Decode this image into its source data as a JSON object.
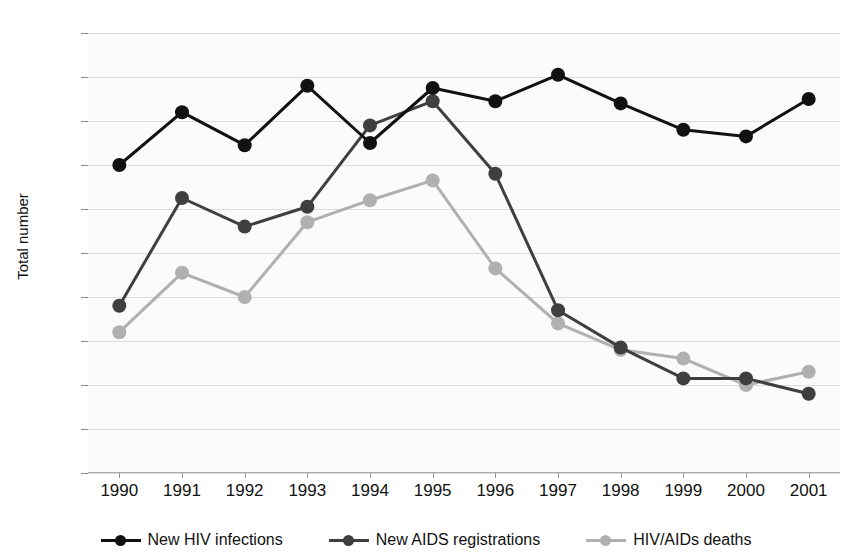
{
  "chart_data": {
    "type": "line",
    "title": "",
    "xlabel": "",
    "ylabel": "Total number",
    "categories": [
      "1990",
      "1991",
      "1992",
      "1993",
      "1994",
      "1995",
      "1996",
      "1997",
      "1998",
      "1999",
      "2000",
      "2001"
    ],
    "x": [
      1990,
      1991,
      1992,
      1993,
      1994,
      1995,
      1996,
      1997,
      1998,
      1999,
      2000,
      2001
    ],
    "ylim": [
      0,
      200
    ],
    "ytick_step": 20,
    "yticks": [
      0,
      20,
      40,
      60,
      80,
      100,
      120,
      140,
      160,
      180,
      200
    ],
    "grid": true,
    "legend_position": "bottom",
    "series": [
      {
        "name": "New HIV infections",
        "color": "#111111",
        "values": [
          140,
          164,
          149,
          176,
          150,
          175,
          169,
          181,
          168,
          156,
          153,
          170
        ]
      },
      {
        "name": "New AIDS registrations",
        "color": "#3f3f3f",
        "values": [
          76,
          125,
          112,
          121,
          158,
          169,
          136,
          74,
          57,
          43,
          43,
          36
        ]
      },
      {
        "name": "HIV/AIDs deaths",
        "color": "#b0b0b0",
        "values": [
          64,
          91,
          80,
          114,
          124,
          133,
          93,
          68,
          56,
          52,
          40,
          46
        ]
      }
    ]
  },
  "style": {
    "plot_background": "#fbfbfb",
    "grid_color": "#dcdcdc",
    "axis_color": "#aaaaaa",
    "text_color": "#111111"
  }
}
